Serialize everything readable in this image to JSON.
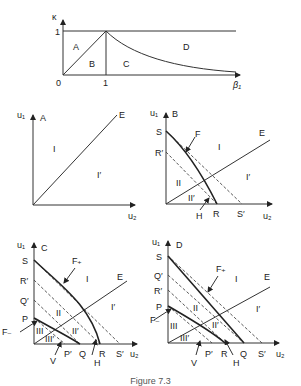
{
  "figure": {
    "caption": "Figure 7.3",
    "top_chart": {
      "y_axis_label": "κ",
      "x_axis_label": "β₁",
      "y_tick": "1",
      "x_ticks": [
        "0",
        "1"
      ],
      "regions": [
        "A",
        "B",
        "C",
        "D"
      ]
    },
    "panels": [
      {
        "id": "A",
        "y_label": "u₁",
        "x_label": "u₂",
        "line_label": "E",
        "regions": [
          "I",
          "I′"
        ]
      },
      {
        "id": "B",
        "y_label": "u₁",
        "x_label": "u₂",
        "line_label": "E",
        "y_points": [
          "S",
          "R′"
        ],
        "x_points": [
          "R",
          "S′"
        ],
        "curve_labels": [
          "F",
          "H"
        ],
        "regions": [
          "I",
          "I′",
          "II",
          "II′"
        ]
      },
      {
        "id": "C",
        "y_label": "u₁",
        "x_label": "u₂",
        "line_label": "E",
        "y_points": [
          "S",
          "R′",
          "Q′",
          "P"
        ],
        "x_points": [
          "P′",
          "Q",
          "R",
          "S′"
        ],
        "curve_labels": [
          "F₊",
          "F₋",
          "V",
          "H"
        ],
        "regions": [
          "I",
          "I′",
          "II",
          "II′",
          "III",
          "III′"
        ]
      },
      {
        "id": "D",
        "y_label": "u₁",
        "x_label": "u₂",
        "line_label": "E",
        "y_points": [
          "S",
          "Q′",
          "R′",
          "P"
        ],
        "x_points": [
          "P′",
          "R",
          "Q",
          "S′"
        ],
        "curve_labels": [
          "F₊",
          "F₋",
          "V",
          "H"
        ],
        "regions": [
          "I",
          "I′",
          "II",
          "II′",
          "III",
          "III′"
        ]
      }
    ]
  }
}
